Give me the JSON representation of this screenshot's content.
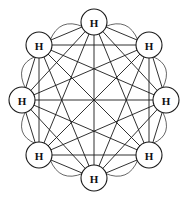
{
  "figure": {
    "background_color": "#ffffff",
    "width": 183,
    "height": 197
  },
  "style": {
    "chord_color": "#1a1a1a",
    "chord_width": 0.9,
    "arc_color": "#555555",
    "arc_width": 0.9,
    "node_fill": "#ffffff",
    "node_stroke": "#1a1a1a",
    "node_stroke_width": 1.1,
    "label_color": "#101010"
  },
  "chart_data": {
    "type": "diagram",
    "graph": "complete",
    "node_count": 8,
    "edge_count": 28,
    "layout": "circular",
    "center": [
      94,
      100
    ],
    "layout_radius": 78,
    "node_radius": 13,
    "nodes": [
      {
        "id": 0,
        "label": "H",
        "cx": 94,
        "cy": 22,
        "position": "top"
      },
      {
        "id": 1,
        "label": "H",
        "cx": 149,
        "cy": 45,
        "position": "upper-right"
      },
      {
        "id": 2,
        "label": "H",
        "cx": 166,
        "cy": 100,
        "position": "right"
      },
      {
        "id": 3,
        "label": "H",
        "cx": 149,
        "cy": 155,
        "position": "lower-right"
      },
      {
        "id": 4,
        "label": "H",
        "cx": 94,
        "cy": 178,
        "position": "bottom"
      },
      {
        "id": 5,
        "label": "H",
        "cx": 39,
        "cy": 155,
        "position": "lower-left"
      },
      {
        "id": 6,
        "label": "H",
        "cx": 22,
        "cy": 100,
        "position": "left"
      },
      {
        "id": 7,
        "label": "H",
        "cx": 39,
        "cy": 45,
        "position": "upper-left"
      }
    ],
    "edges": [
      [
        0,
        1
      ],
      [
        0,
        2
      ],
      [
        0,
        3
      ],
      [
        0,
        4
      ],
      [
        0,
        5
      ],
      [
        0,
        6
      ],
      [
        0,
        7
      ],
      [
        1,
        2
      ],
      [
        1,
        3
      ],
      [
        1,
        4
      ],
      [
        1,
        5
      ],
      [
        1,
        6
      ],
      [
        1,
        7
      ],
      [
        2,
        3
      ],
      [
        2,
        4
      ],
      [
        2,
        5
      ],
      [
        2,
        6
      ],
      [
        2,
        7
      ],
      [
        3,
        4
      ],
      [
        3,
        5
      ],
      [
        3,
        6
      ],
      [
        3,
        7
      ],
      [
        4,
        5
      ],
      [
        4,
        6
      ],
      [
        4,
        7
      ],
      [
        5,
        6
      ],
      [
        5,
        7
      ],
      [
        6,
        7
      ]
    ],
    "outer_arcs": [
      [
        0,
        1
      ],
      [
        1,
        2
      ],
      [
        2,
        3
      ],
      [
        3,
        4
      ],
      [
        4,
        5
      ],
      [
        5,
        6
      ],
      [
        6,
        7
      ],
      [
        7,
        0
      ]
    ],
    "arc_bulge": 9
  }
}
